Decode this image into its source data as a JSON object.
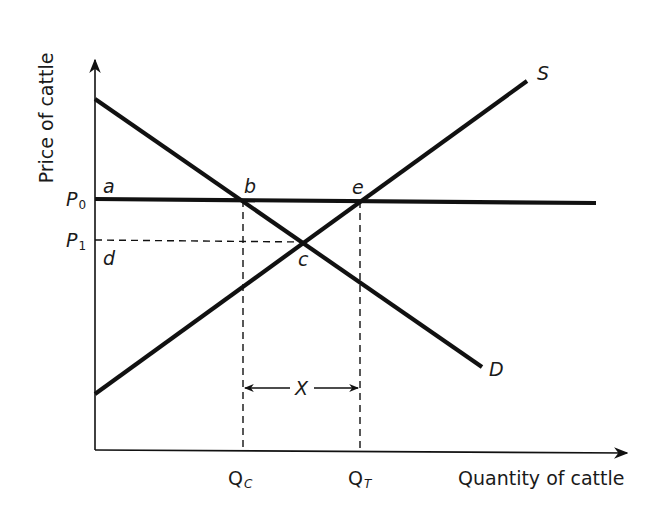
{
  "diagram": {
    "axes": {
      "y_label": "Price of cattle",
      "x_label": "Quantity of cattle"
    },
    "price_levels": [
      {
        "symbol": "P",
        "sub": "0",
        "name": "P0"
      },
      {
        "symbol": "P",
        "sub": "1",
        "name": "P1"
      }
    ],
    "quantity_levels": [
      {
        "symbol": "Q",
        "sub": "C",
        "name": "QC"
      },
      {
        "symbol": "Q",
        "sub": "T",
        "name": "QT"
      }
    ],
    "curves": {
      "supply": "S",
      "demand": "D"
    },
    "points": {
      "a": "a",
      "b": "b",
      "c": "c",
      "d": "d",
      "e": "e"
    },
    "gap_label": "X",
    "colors": {
      "line": "#111111",
      "text": "#1a1a1a",
      "background": "#ffffff"
    }
  }
}
